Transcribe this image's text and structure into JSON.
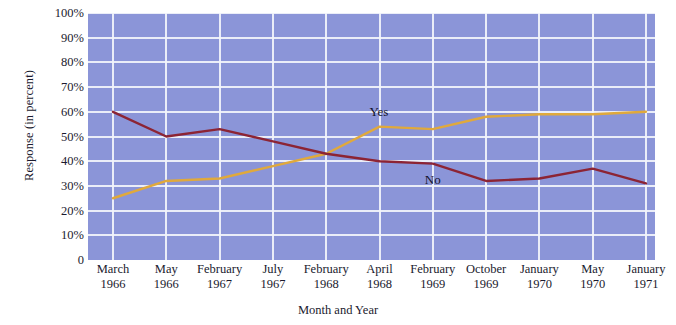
{
  "chart_data": {
    "type": "line",
    "title": "",
    "xlabel": "Month and Year",
    "ylabel": "Response (in percent)",
    "ylim": [
      0,
      100
    ],
    "grid": true,
    "legend_position": "inline-annotation",
    "categories": [
      "March 1966",
      "May 1966",
      "February 1967",
      "July 1967",
      "February 1968",
      "April 1968",
      "February 1969",
      "October 1969",
      "January 1970",
      "May 1970",
      "January 1971"
    ],
    "category_months": [
      "March",
      "May",
      "February",
      "July",
      "February",
      "April",
      "February",
      "October",
      "January",
      "May",
      "January"
    ],
    "category_years": [
      "1966",
      "1966",
      "1967",
      "1967",
      "1968",
      "1968",
      "1969",
      "1969",
      "1970",
      "1970",
      "1971"
    ],
    "y_ticks": [
      "100%",
      "90%",
      "80%",
      "70%",
      "60%",
      "50%",
      "40%",
      "30%",
      "20%",
      "10%",
      "0"
    ],
    "y_tick_values": [
      100,
      90,
      80,
      70,
      60,
      50,
      40,
      30,
      20,
      10,
      0
    ],
    "series": [
      {
        "name": "Yes",
        "color": "#e0a93c",
        "values": [
          25,
          32,
          33,
          38,
          43,
          54,
          53,
          58,
          59,
          59,
          60
        ]
      },
      {
        "name": "No",
        "color": "#8c2434",
        "values": [
          60,
          50,
          53,
          48,
          43,
          40,
          39,
          32,
          33,
          37,
          31
        ]
      }
    ],
    "annotations": [
      {
        "text": "Yes",
        "series": "Yes",
        "near_category": "April 1968"
      },
      {
        "text": "No",
        "series": "No",
        "near_category": "February 1969"
      }
    ]
  },
  "style": {
    "plot_background": "#8b95d8",
    "gridline_color": "#f2f4fb",
    "page_background": "#ffffff",
    "text_color": "#1a1a2e"
  }
}
